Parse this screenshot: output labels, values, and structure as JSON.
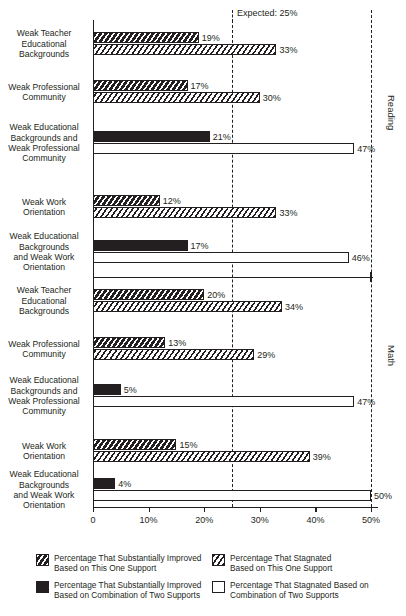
{
  "chart_data": {
    "type": "bar",
    "title": "",
    "xlabel": "",
    "ylabel": "",
    "xlim": [
      0,
      50
    ],
    "grid": false,
    "orientation": "horizontal",
    "axis": {
      "ticks": [
        0,
        10,
        20,
        30,
        40,
        50
      ],
      "tick_labels": [
        "0",
        "10%",
        "20%",
        "30%",
        "40%",
        "50%"
      ]
    },
    "annotations": [
      {
        "name": "expected",
        "label": "Expected: 25%",
        "value": 25
      }
    ],
    "groups": [
      {
        "name": "Reading",
        "label": "Reading",
        "rows": [
          {
            "label": "Weak Teacher\nEducational\nBackgrounds",
            "label_lines": [
              "Weak Teacher",
              "Educational",
              "Backgrounds"
            ],
            "kind": "single",
            "improved": 19,
            "stagnated": 33,
            "improved_label": "19%",
            "stagnated_label": "33%"
          },
          {
            "label": "Weak Professional\nCommunity",
            "label_lines": [
              "Weak Professional",
              "Community"
            ],
            "kind": "single",
            "improved": 17,
            "stagnated": 30,
            "improved_label": "17%",
            "stagnated_label": "30%"
          },
          {
            "label": "Weak Educational\nBackgrounds and\nWeak Professional\nCommunity",
            "label_lines": [
              "Weak Educational",
              "Backgrounds and",
              "Weak Professional",
              "Community"
            ],
            "kind": "combo",
            "improved": 21,
            "stagnated": 47,
            "improved_label": "21%",
            "stagnated_label": "47%"
          },
          {
            "label": "Weak Work\nOrientation",
            "label_lines": [
              "Weak Work",
              "Orientation"
            ],
            "kind": "single",
            "improved": 12,
            "stagnated": 33,
            "improved_label": "12%",
            "stagnated_label": "33%"
          },
          {
            "label": "Weak Educational\nBackgrounds\nand Weak Work\nOrientation",
            "label_lines": [
              "Weak Educational",
              "Backgrounds",
              "and Weak Work",
              "Orientation"
            ],
            "kind": "combo",
            "improved": 17,
            "stagnated": 46,
            "improved_label": "17%",
            "stagnated_label": "46%"
          }
        ]
      },
      {
        "name": "Math",
        "label": "Math",
        "rows": [
          {
            "label": "Weak Teacher\nEducational\nBackgrounds",
            "label_lines": [
              "Weak Teacher",
              "Educational",
              "Backgrounds"
            ],
            "kind": "single",
            "improved": 20,
            "stagnated": 34,
            "improved_label": "20%",
            "stagnated_label": "34%"
          },
          {
            "label": "Weak Professional\nCommunity",
            "label_lines": [
              "Weak Professional",
              "Community"
            ],
            "kind": "single",
            "improved": 13,
            "stagnated": 29,
            "improved_label": "13%",
            "stagnated_label": "29%"
          },
          {
            "label": "Weak Educational\nBackgrounds and\nWeak Professional\nCommunity",
            "label_lines": [
              "Weak Educational",
              "Backgrounds and",
              "Weak Professional",
              "Community"
            ],
            "kind": "combo",
            "improved": 5,
            "stagnated": 47,
            "improved_label": "5%",
            "stagnated_label": "47%"
          },
          {
            "label": "Weak Work\nOrientation",
            "label_lines": [
              "Weak Work",
              "Orientation"
            ],
            "kind": "single",
            "improved": 15,
            "stagnated": 39,
            "improved_label": "15%",
            "stagnated_label": "39%"
          },
          {
            "label": "Weak Educational\nBackgrounds\nand Weak Work\nOrientation",
            "label_lines": [
              "Weak Educational",
              "Backgrounds",
              "and Weak Work",
              "Orientation"
            ],
            "kind": "combo",
            "improved": 4,
            "stagnated": 50,
            "improved_label": "4%",
            "stagnated_label": "50%"
          }
        ]
      }
    ],
    "legend": {
      "position": "bottom",
      "entries": [
        {
          "key": "improved-single",
          "swatch": "dark-hatch",
          "lines": [
            "Percentage That Substantially Improved",
            "Based on This One Support"
          ]
        },
        {
          "key": "stagnated-single",
          "swatch": "light-hatch",
          "lines": [
            "Percentage That Stagnated",
            "Based on This One Support"
          ]
        },
        {
          "key": "improved-combo",
          "swatch": "solid-black",
          "lines": [
            "Percentage That Substantially Improved",
            "Based on Combination of Two Supports"
          ]
        },
        {
          "key": "stagnated-combo",
          "swatch": "white-outline",
          "lines": [
            "Percentage That Stagnated Based on",
            "Combination of Two Supports"
          ]
        }
      ]
    },
    "colors": {
      "ink": "#231f20",
      "background": "#ffffff"
    }
  }
}
